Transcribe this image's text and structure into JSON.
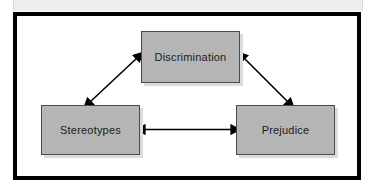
{
  "figure": {
    "type": "triangular relationship diagram",
    "frame_color": "#000000",
    "box_fill_color": "#b5b5b5",
    "box_border_color": "#4a4a4a",
    "box_shadow_color": "#dcdcdc",
    "arrow_color": "#000000",
    "background_color": "#ffffff",
    "header_band_color": "#eeeeee"
  },
  "nodes": [
    {
      "id": "discrimination",
      "label": "Discrimination",
      "position": "top-center"
    },
    {
      "id": "stereotypes",
      "label": "Stereotypes",
      "position": "bottom-left"
    },
    {
      "id": "prejudice",
      "label": "Prejudice",
      "position": "bottom-right"
    }
  ],
  "connections": [
    {
      "from": "stereotypes",
      "to": "discrimination",
      "style": "double-headed arrow",
      "orientation": "diagonal"
    },
    {
      "from": "discrimination",
      "to": "prejudice",
      "style": "double-headed arrow",
      "orientation": "diagonal"
    },
    {
      "from": "stereotypes",
      "to": "prejudice",
      "style": "double-headed arrow",
      "orientation": "horizontal"
    }
  ]
}
